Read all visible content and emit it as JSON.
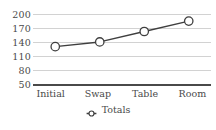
{
  "chart_data": {
    "type": "line",
    "title": "",
    "xlabel": "",
    "ylabel": "",
    "categories": [
      "Initial",
      "Swap",
      "Table",
      "Room"
    ],
    "series": [
      {
        "name": "Totals",
        "values": [
          131,
          141,
          163,
          185
        ]
      }
    ],
    "yticks": [
      200,
      170,
      140,
      110,
      80,
      50
    ],
    "ylim": [
      50,
      200
    ],
    "grid": true,
    "legend_position": "bottom",
    "marker": "open-circle",
    "colors": {
      "line": "#3f3f3f",
      "marker_fill": "#ffffff",
      "marker_stroke": "#3f3f3f",
      "gridline": "#d2d2d2",
      "axis": "#4a4a4a",
      "text": "#4a4a4a",
      "background": "#ffffff"
    }
  },
  "legend": {
    "marker_icon": "open-circle-marker-icon",
    "entries": [
      {
        "label": "Totals"
      }
    ]
  }
}
